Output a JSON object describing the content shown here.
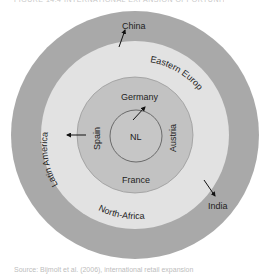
{
  "caption_top": "FIGURE 14.4 INTERNATIONAL EXPANSION OPPORTUNITIES",
  "caption_bottom": "Source: Bijmolt et al. (2006), international retail expansion",
  "colors": {
    "outer_ring": "#a9a9a9",
    "middle_ring": "#e2e2e2",
    "inner_ring": "#c2c2c2",
    "core": "#c6c6c6",
    "core_outline": "#6a6a6a",
    "arrow": "#111111",
    "text": "#222222"
  },
  "diagram": {
    "center": {
      "label": "NL"
    },
    "inner_ring": {
      "labels": {
        "top": "Germany",
        "left": "Spain",
        "right": "Austria",
        "bottom": "France"
      }
    },
    "middle_ring": {
      "labels": {
        "top_right": "Eastern Europe",
        "left": "Latin America",
        "bottom": "North-Africa"
      }
    },
    "outer_ring": {
      "labels": {
        "top": "China",
        "bottom_right": "India"
      }
    },
    "arrows": [
      {
        "from": "NL",
        "to": "Germany"
      },
      {
        "from": "Spain",
        "to": "Latin America"
      },
      {
        "from": "Eastern Europe",
        "to": "China"
      },
      {
        "from": "Eastern Europe",
        "to": "India"
      }
    ]
  }
}
